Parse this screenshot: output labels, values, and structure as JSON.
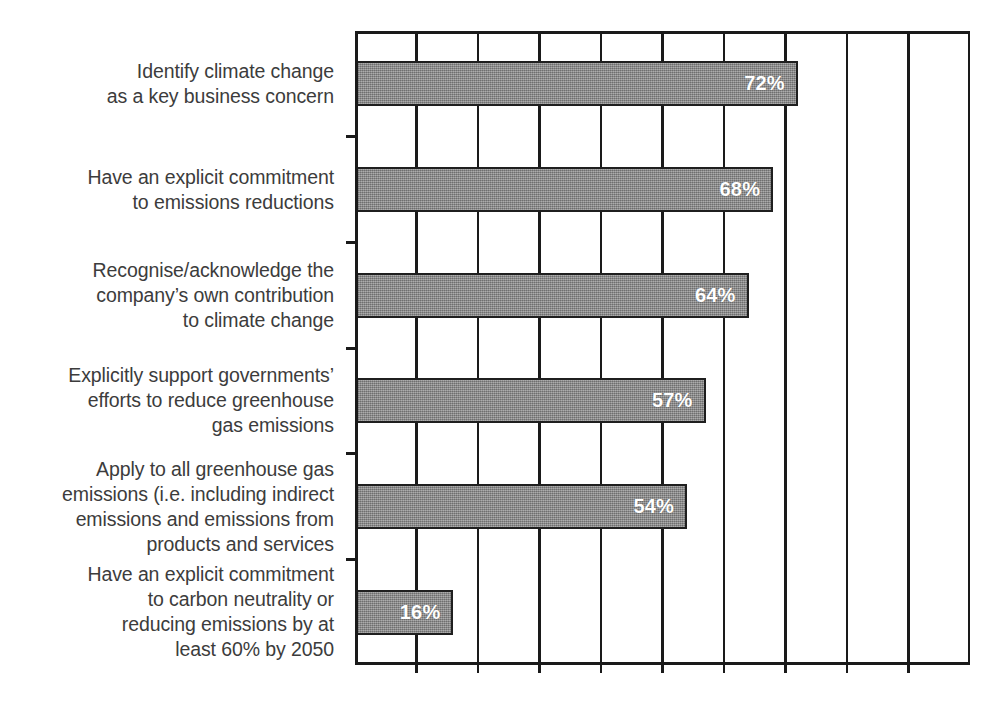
{
  "chart_data": {
    "type": "bar",
    "orientation": "horizontal",
    "title": "",
    "subtitle": "",
    "xlabel": "",
    "ylabel": "",
    "xlim": [
      0,
      100
    ],
    "ylim": null,
    "grid": true,
    "grid_axis": "x",
    "grid_interval": 10,
    "legend": null,
    "legend_position": "none",
    "x_tick_labels": [],
    "value_label_suffix": "%",
    "bar_fill_color": "#8c8c8c",
    "bar_border_color": "#1f1f1f",
    "value_text_color": "#ffffff",
    "axis_color": "#1a1a1a",
    "background_color": "#ffffff",
    "categories": [
      "Identify climate change\nas a key business concern",
      "Have an explicit commitment\nto emissions reductions",
      "Recognise/acknowledge the\ncompany’s own contribution\nto climate change",
      "Explicitly support governments’\nefforts to reduce greenhouse\ngas emissions",
      "Apply to all greenhouse gas\nemissions (i.e. including indirect\nemissions and emissions from\nproducts and services",
      "Have an explicit commitment\nto carbon neutrality or\nreducing emissions by at\nleast 60% by 2050"
    ],
    "values": [
      72,
      68,
      64,
      57,
      54,
      16
    ],
    "value_labels": [
      "72%",
      "68%",
      "64%",
      "57%",
      "54%",
      "16%"
    ]
  },
  "gridlines": {
    "count": 9,
    "positions_percent": [
      10,
      20,
      30,
      40,
      50,
      60,
      70,
      80,
      90
    ]
  },
  "y_ticks": {
    "count": 5,
    "positions_percent": [
      16.67,
      33.33,
      50,
      66.67,
      83.33
    ]
  }
}
